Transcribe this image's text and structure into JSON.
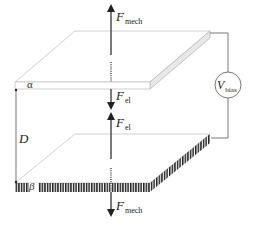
{
  "diagram": {
    "type": "parallel-plate-actuator-schematic",
    "labels": {
      "f_mech_top": {
        "symbol": "F",
        "subscript": "mech"
      },
      "f_el_top": {
        "symbol": "F",
        "subscript": "el"
      },
      "f_el_bottom": {
        "symbol": "F",
        "subscript": "el"
      },
      "f_mech_bottom": {
        "symbol": "F",
        "subscript": "mech"
      },
      "v_bias": {
        "symbol": "V",
        "subscript": "bias"
      },
      "gap": "D",
      "top_plate": "α",
      "bottom_plate": "β"
    },
    "colors": {
      "stroke": "#333333",
      "plate_edge": "#bbbbbb",
      "plate_side_fill": "#e6e6e6",
      "hatch": "#222222",
      "background": "#ffffff"
    }
  }
}
